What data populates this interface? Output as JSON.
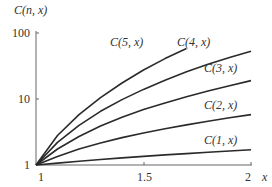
{
  "chart_data": {
    "type": "line",
    "title": "",
    "xlabel": "x",
    "ylabel": "C(n, x)",
    "xlim": [
      1,
      2
    ],
    "ylim": [
      1,
      100
    ],
    "yscale": "log",
    "grid": false,
    "legend": "inline labels near curve ends",
    "x_ticks": [
      "1",
      "1.5",
      "2"
    ],
    "y_ticks": [
      "1",
      "10",
      "100"
    ],
    "x": [
      1.0,
      1.1,
      1.2,
      1.3,
      1.4,
      1.5,
      1.6,
      1.7,
      1.8,
      1.9,
      2.0
    ],
    "series": [
      {
        "name": "C(1, x)",
        "label": "C(1, x)",
        "values": [
          1.0,
          1.07,
          1.14,
          1.21,
          1.28,
          1.35,
          1.42,
          1.49,
          1.56,
          1.63,
          1.7
        ]
      },
      {
        "name": "C(2, x)",
        "label": "C(2, x)",
        "values": [
          1.0,
          1.35,
          1.75,
          2.15,
          2.6,
          3.05,
          3.55,
          4.05,
          4.6,
          5.2,
          5.8
        ]
      },
      {
        "name": "C(3, x)",
        "label": "C(3, x)",
        "values": [
          1.0,
          1.75,
          2.7,
          3.9,
          5.3,
          6.9,
          8.7,
          10.8,
          13.2,
          15.9,
          19.0
        ]
      },
      {
        "name": "C(4, x)",
        "label": "C(4, x)",
        "values": [
          1.0,
          2.2,
          4.0,
          6.5,
          9.8,
          14.0,
          19.3,
          25.8,
          33.5,
          42.5,
          53.0
        ]
      },
      {
        "name": "C(5, x)",
        "label": "C(5, x)",
        "values": [
          1.0,
          2.8,
          5.8,
          10.5,
          17.5,
          27.5,
          41.0,
          58.0,
          null,
          null,
          null
        ]
      }
    ]
  },
  "labels": {
    "ylabel": "C(n, x)",
    "xlabel": "x",
    "ytick_100": "100",
    "ytick_10": "10",
    "ytick_1": "1",
    "xtick_1": "1",
    "xtick_15": "1.5",
    "xtick_2": "2",
    "c5": "C(5, x)",
    "c4": "C(4, x)",
    "c3": "C(3, x)",
    "c2": "C(2, x)",
    "c1": "C(1, x)"
  },
  "colors": {
    "curve": "#2a2a2a",
    "axis": "#555555"
  }
}
